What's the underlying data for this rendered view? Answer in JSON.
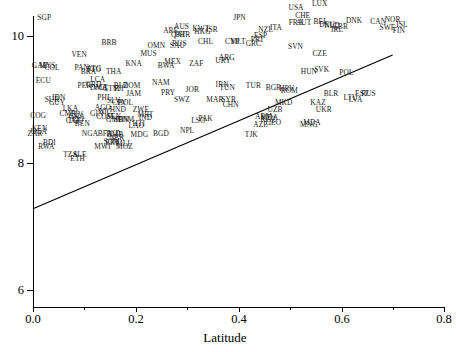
{
  "chart_data": {
    "type": "scatter",
    "title": "",
    "xlabel": "Latitude",
    "ylabel": "",
    "xlim": [
      0.0,
      0.8
    ],
    "ylim": [
      6,
      10.6
    ],
    "xticks": [
      "0.0",
      "0.2",
      "0.4",
      "0.6",
      "0.8"
    ],
    "xtick_values": [
      0.0,
      0.2,
      0.4,
      0.6,
      0.8
    ],
    "yticks": [
      "6",
      "8",
      "10"
    ],
    "ytick_values": [
      6,
      8,
      10
    ],
    "grid": false,
    "legend": null,
    "marker_style": "text-label",
    "annotations": [
      {
        "name": "regression-line",
        "type": "line",
        "x0": 0.0,
        "y0": 7.28,
        "x1": 0.7,
        "y1": 9.7
      }
    ],
    "points": [
      {
        "label": "SGP",
        "x": 0.022,
        "y": 10.29
      },
      {
        "label": "HKG",
        "x": 0.33,
        "y": 10.06
      },
      {
        "label": "USA",
        "x": 0.512,
        "y": 10.44
      },
      {
        "label": "LUX",
        "x": 0.558,
        "y": 10.51
      },
      {
        "label": "CHE",
        "x": 0.525,
        "y": 10.32
      },
      {
        "label": "JPN",
        "x": 0.402,
        "y": 10.28
      },
      {
        "label": "NOR",
        "x": 0.7,
        "y": 10.26
      },
      {
        "label": "DNK",
        "x": 0.625,
        "y": 10.23
      },
      {
        "label": "CAN",
        "x": 0.672,
        "y": 10.22
      },
      {
        "label": "AUT",
        "x": 0.527,
        "y": 10.21
      },
      {
        "label": "FRA",
        "x": 0.512,
        "y": 10.21
      },
      {
        "label": "BEL",
        "x": 0.56,
        "y": 10.22
      },
      {
        "label": "DEU",
        "x": 0.572,
        "y": 10.18
      },
      {
        "label": "NLD",
        "x": 0.582,
        "y": 10.16
      },
      {
        "label": "GBR",
        "x": 0.598,
        "y": 10.15
      },
      {
        "label": "ISL",
        "x": 0.718,
        "y": 10.18
      },
      {
        "label": "SWE",
        "x": 0.69,
        "y": 10.12
      },
      {
        "label": "FIN",
        "x": 0.712,
        "y": 10.08
      },
      {
        "label": "AUS",
        "x": 0.289,
        "y": 10.15
      },
      {
        "label": "ARE",
        "x": 0.268,
        "y": 10.08
      },
      {
        "label": "KWT",
        "x": 0.327,
        "y": 10.11
      },
      {
        "label": "ISR",
        "x": 0.348,
        "y": 10.09
      },
      {
        "label": "QAT",
        "x": 0.283,
        "y": 10.01
      },
      {
        "label": "NZL",
        "x": 0.453,
        "y": 10.1
      },
      {
        "label": "BHR",
        "x": 0.291,
        "y": 10.02
      },
      {
        "label": "ITA",
        "x": 0.473,
        "y": 10.13
      },
      {
        "label": "IRL",
        "x": 0.592,
        "y": 10.09
      },
      {
        "label": "ESP",
        "x": 0.443,
        "y": 10.0
      },
      {
        "label": "PRT",
        "x": 0.437,
        "y": 9.93
      },
      {
        "label": "MLT",
        "x": 0.399,
        "y": 9.9
      },
      {
        "label": "CYP",
        "x": 0.388,
        "y": 9.9
      },
      {
        "label": "GRC",
        "x": 0.429,
        "y": 9.88
      },
      {
        "label": "CHL",
        "x": 0.336,
        "y": 9.91
      },
      {
        "label": "BRB",
        "x": 0.148,
        "y": 9.89
      },
      {
        "label": "OMN",
        "x": 0.24,
        "y": 9.84
      },
      {
        "label": "RUS",
        "x": 0.285,
        "y": 9.88
      },
      {
        "label": "SAU",
        "x": 0.281,
        "y": 9.85
      },
      {
        "label": "SVN",
        "x": 0.511,
        "y": 9.83
      },
      {
        "label": "CZE",
        "x": 0.558,
        "y": 9.71
      },
      {
        "label": "MUS",
        "x": 0.225,
        "y": 9.72
      },
      {
        "label": "VEN",
        "x": 0.09,
        "y": 9.7
      },
      {
        "label": "ARG",
        "x": 0.377,
        "y": 9.65
      },
      {
        "label": "URY",
        "x": 0.37,
        "y": 9.61
      },
      {
        "label": "MEX",
        "x": 0.272,
        "y": 9.59
      },
      {
        "label": "ZAF",
        "x": 0.318,
        "y": 9.56
      },
      {
        "label": "KNA",
        "x": 0.196,
        "y": 9.56
      },
      {
        "label": "BWA",
        "x": 0.259,
        "y": 9.53
      },
      {
        "label": "GAB",
        "x": 0.013,
        "y": 9.53
      },
      {
        "label": "MYS",
        "x": 0.028,
        "y": 9.53
      },
      {
        "label": "COL",
        "x": 0.037,
        "y": 9.49
      },
      {
        "label": "PAN",
        "x": 0.095,
        "y": 9.5
      },
      {
        "label": "ATG",
        "x": 0.119,
        "y": 9.48
      },
      {
        "label": "TTO",
        "x": 0.118,
        "y": 9.46
      },
      {
        "label": "BRA",
        "x": 0.108,
        "y": 9.43
      },
      {
        "label": "THA",
        "x": 0.157,
        "y": 9.44
      },
      {
        "label": "HUN",
        "x": 0.537,
        "y": 9.43
      },
      {
        "label": "SVK",
        "x": 0.562,
        "y": 9.46
      },
      {
        "label": "POL",
        "x": 0.61,
        "y": 9.42
      },
      {
        "label": "ECU",
        "x": 0.02,
        "y": 9.29
      },
      {
        "label": "LCA",
        "x": 0.126,
        "y": 9.31
      },
      {
        "label": "NAM",
        "x": 0.249,
        "y": 9.26
      },
      {
        "label": "IRN",
        "x": 0.368,
        "y": 9.23
      },
      {
        "label": "TUN",
        "x": 0.378,
        "y": 9.18
      },
      {
        "label": "TUR",
        "x": 0.429,
        "y": 9.22
      },
      {
        "label": "BGR",
        "x": 0.468,
        "y": 9.18
      },
      {
        "label": "ROM",
        "x": 0.499,
        "y": 9.14
      },
      {
        "label": "HRV",
        "x": 0.494,
        "y": 9.17
      },
      {
        "label": "BLR",
        "x": 0.58,
        "y": 9.08
      },
      {
        "label": "EST",
        "x": 0.64,
        "y": 9.09
      },
      {
        "label": "RUS2",
        "x": 0.653,
        "y": 9.09
      },
      {
        "label": "LTU",
        "x": 0.618,
        "y": 9.03
      },
      {
        "label": "LVA",
        "x": 0.628,
        "y": 9.0
      },
      {
        "label": "PER",
        "x": 0.1,
        "y": 9.22
      },
      {
        "label": "GRD",
        "x": 0.118,
        "y": 9.23
      },
      {
        "label": "DMA",
        "x": 0.128,
        "y": 9.18
      },
      {
        "label": "VCT",
        "x": 0.131,
        "y": 9.18
      },
      {
        "label": "BLZ",
        "x": 0.171,
        "y": 9.22
      },
      {
        "label": "DOM",
        "x": 0.192,
        "y": 9.21
      },
      {
        "label": "GTM",
        "x": 0.152,
        "y": 9.16
      },
      {
        "label": "JOR",
        "x": 0.31,
        "y": 9.15
      },
      {
        "label": "FJI",
        "x": 0.167,
        "y": 9.16
      },
      {
        "label": "IDN",
        "x": 0.05,
        "y": 9.03
      },
      {
        "label": "SUR",
        "x": 0.037,
        "y": 8.99
      },
      {
        "label": "GUY",
        "x": 0.047,
        "y": 8.95
      },
      {
        "label": "PHL",
        "x": 0.139,
        "y": 9.02
      },
      {
        "label": "JAM",
        "x": 0.196,
        "y": 9.09
      },
      {
        "label": "PRY",
        "x": 0.263,
        "y": 9.1
      },
      {
        "label": "SWZ",
        "x": 0.29,
        "y": 9.0
      },
      {
        "label": "MAR",
        "x": 0.354,
        "y": 8.99
      },
      {
        "label": "SYR",
        "x": 0.381,
        "y": 8.99
      },
      {
        "label": "MKD",
        "x": 0.488,
        "y": 8.94
      },
      {
        "label": "KAZ",
        "x": 0.555,
        "y": 8.95
      },
      {
        "label": "CHN",
        "x": 0.385,
        "y": 8.92
      },
      {
        "label": "LKA",
        "x": 0.073,
        "y": 8.85
      },
      {
        "label": "SLV",
        "x": 0.157,
        "y": 8.97
      },
      {
        "label": "BOL",
        "x": 0.18,
        "y": 8.95
      },
      {
        "label": "CPV",
        "x": 0.168,
        "y": 8.95
      },
      {
        "label": "AGO",
        "x": 0.136,
        "y": 8.87
      },
      {
        "label": "HND",
        "x": 0.165,
        "y": 8.84
      },
      {
        "label": "ZWE",
        "x": 0.21,
        "y": 8.83
      },
      {
        "label": "UZB",
        "x": 0.471,
        "y": 8.83
      },
      {
        "label": "UKR",
        "x": 0.566,
        "y": 8.83
      },
      {
        "label": "COG",
        "x": 0.01,
        "y": 8.74
      },
      {
        "label": "CMR",
        "x": 0.068,
        "y": 8.78
      },
      {
        "label": "CIV",
        "x": 0.085,
        "y": 8.75
      },
      {
        "label": "GHA",
        "x": 0.085,
        "y": 8.72
      },
      {
        "label": "GIN",
        "x": 0.124,
        "y": 8.77
      },
      {
        "label": "NIC",
        "x": 0.141,
        "y": 8.8
      },
      {
        "label": "COM",
        "x": 0.14,
        "y": 8.73
      },
      {
        "label": "SEN",
        "x": 0.157,
        "y": 8.73
      },
      {
        "label": "MRT",
        "x": 0.219,
        "y": 8.75
      },
      {
        "label": "IND",
        "x": 0.219,
        "y": 8.71
      },
      {
        "label": "ARM",
        "x": 0.449,
        "y": 8.73
      },
      {
        "label": "MDA",
        "x": 0.46,
        "y": 8.71
      },
      {
        "label": "KGZ",
        "x": 0.458,
        "y": 8.68
      },
      {
        "label": "AZE",
        "x": 0.443,
        "y": 8.6
      },
      {
        "label": "GEO",
        "x": 0.468,
        "y": 8.63
      },
      {
        "label": "MDA2",
        "x": 0.543,
        "y": 8.63
      },
      {
        "label": "MNG",
        "x": 0.537,
        "y": 8.6
      },
      {
        "label": "PAK",
        "x": 0.336,
        "y": 8.7
      },
      {
        "label": "LSO",
        "x": 0.322,
        "y": 8.67
      },
      {
        "label": "CAF",
        "x": 0.078,
        "y": 8.67
      },
      {
        "label": "TGO",
        "x": 0.083,
        "y": 8.67
      },
      {
        "label": "BEN",
        "x": 0.096,
        "y": 8.62
      },
      {
        "label": "GMB",
        "x": 0.159,
        "y": 8.68
      },
      {
        "label": "SDN",
        "x": 0.172,
        "y": 8.68
      },
      {
        "label": "VNM",
        "x": 0.18,
        "y": 8.68
      },
      {
        "label": "HTI",
        "x": 0.206,
        "y": 8.62
      },
      {
        "label": "LAO",
        "x": 0.201,
        "y": 8.58
      },
      {
        "label": "KEN",
        "x": 0.013,
        "y": 8.53
      },
      {
        "label": "UGA",
        "x": 0.011,
        "y": 8.49
      },
      {
        "label": "ZAR",
        "x": 0.004,
        "y": 8.45
      },
      {
        "label": "NGA",
        "x": 0.111,
        "y": 8.45
      },
      {
        "label": "BFA",
        "x": 0.14,
        "y": 8.45
      },
      {
        "label": "TCD",
        "x": 0.156,
        "y": 8.46
      },
      {
        "label": "ZMB",
        "x": 0.16,
        "y": 8.44
      },
      {
        "label": "MDG",
        "x": 0.207,
        "y": 8.44
      },
      {
        "label": "BGD",
        "x": 0.249,
        "y": 8.46
      },
      {
        "label": "NPL",
        "x": 0.3,
        "y": 8.51
      },
      {
        "label": "TJK",
        "x": 0.425,
        "y": 8.44
      },
      {
        "label": "NER",
        "x": 0.163,
        "y": 8.4
      },
      {
        "label": "SOM",
        "x": 0.153,
        "y": 8.33
      },
      {
        "label": "ERI",
        "x": 0.153,
        "y": 8.32
      },
      {
        "label": "MLI",
        "x": 0.175,
        "y": 8.3
      },
      {
        "label": "BDI",
        "x": 0.032,
        "y": 8.31
      },
      {
        "label": "RWA",
        "x": 0.026,
        "y": 8.26
      },
      {
        "label": "MWI",
        "x": 0.135,
        "y": 8.25
      },
      {
        "label": "MOZ",
        "x": 0.178,
        "y": 8.25
      },
      {
        "label": "TZA",
        "x": 0.073,
        "y": 8.13
      },
      {
        "label": "SLE",
        "x": 0.091,
        "y": 8.13
      },
      {
        "label": "ETH",
        "x": 0.087,
        "y": 8.06
      }
    ]
  },
  "axes": {
    "x_title": "Latitude",
    "x_tick_labels": [
      "0.0",
      "0.2",
      "0.4",
      "0.6",
      "0.8"
    ],
    "y_tick_labels": [
      "10",
      "8",
      "6"
    ]
  }
}
